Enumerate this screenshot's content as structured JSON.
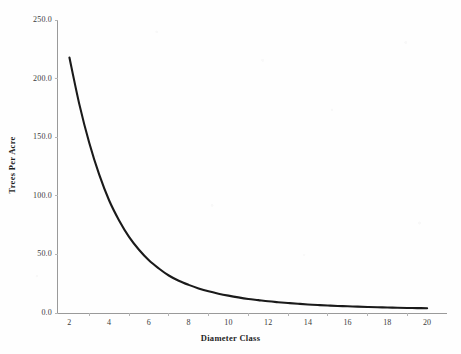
{
  "chart_data": {
    "type": "line",
    "title": "",
    "xlabel": "Diameter Class",
    "ylabel": "Trees Per Acre",
    "xlim": [
      1.4,
      21.0
    ],
    "ylim": [
      0.0,
      250.0
    ],
    "grid": false,
    "legend": null,
    "x_tick_labels": [
      "2",
      "4",
      "6",
      "8",
      "10",
      "12",
      "14",
      "16",
      "18",
      "20"
    ],
    "x_ticks": [
      2,
      4,
      6,
      8,
      10,
      12,
      14,
      16,
      18,
      20
    ],
    "y_tick_labels": [
      "250.0",
      "200.0",
      "150.0",
      "100.0",
      "50.0",
      "0.0"
    ],
    "y_ticks": [
      250.0,
      200.0,
      150.0,
      100.0,
      50.0,
      0.0
    ],
    "series": [
      {
        "name": "Trees Per Acre",
        "color": "#1a1a1a",
        "x": [
          2,
          2.5,
          3,
          3.5,
          4,
          4.5,
          5,
          5.5,
          6,
          6.5,
          7,
          7.5,
          8,
          8.5,
          9,
          9.5,
          10,
          10.5,
          11,
          11.5,
          12,
          12.5,
          13,
          13.5,
          14,
          14.5,
          15,
          15.5,
          16,
          16.5,
          17,
          17.5,
          18,
          18.5,
          19,
          19.5,
          20
        ],
        "values": [
          218.0,
          178.0,
          145.0,
          118.0,
          96.0,
          79.0,
          65.0,
          54.0,
          45.0,
          38.0,
          32.0,
          27.5,
          24.0,
          21.0,
          18.5,
          16.5,
          14.8,
          13.3,
          12.0,
          11.0,
          10.0,
          9.2,
          8.5,
          7.9,
          7.3,
          6.8,
          6.4,
          6.0,
          5.7,
          5.4,
          5.1,
          4.9,
          4.7,
          4.5,
          4.3,
          4.2,
          4.0
        ]
      }
    ]
  },
  "axes": {
    "x_title": "Diameter Class",
    "y_title": "Trees Per Acre"
  }
}
